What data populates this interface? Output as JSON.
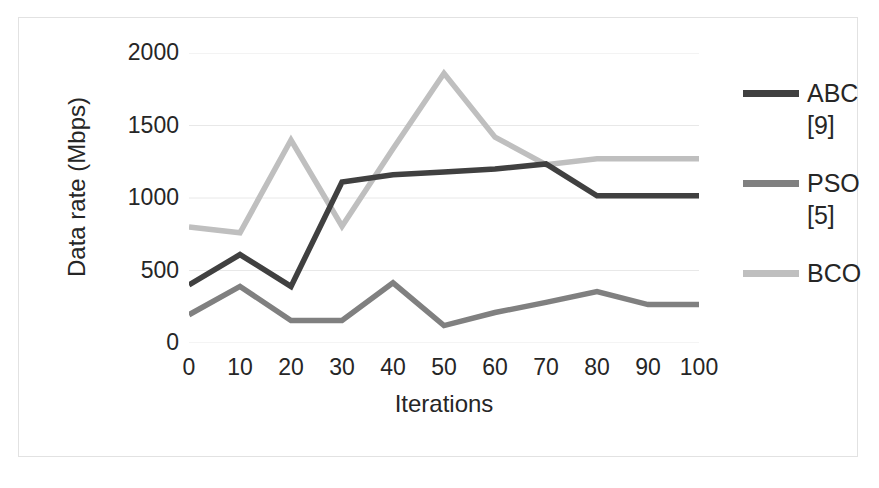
{
  "chart_data": {
    "type": "line",
    "title": "",
    "xlabel": "Iterations",
    "ylabel": "Data rate (Mbps)",
    "x": [
      0,
      10,
      20,
      30,
      40,
      50,
      60,
      70,
      80,
      90,
      100
    ],
    "categories": [
      "0",
      "10",
      "20",
      "30",
      "40",
      "50",
      "60",
      "70",
      "80",
      "90",
      "100"
    ],
    "xlim": [
      0,
      100
    ],
    "ylim": [
      0,
      2000
    ],
    "yticks": [
      0,
      500,
      1000,
      1500,
      2000
    ],
    "ytick_labels": [
      "0",
      "500",
      "1000",
      "1500",
      "2000"
    ],
    "grid": "horizontal",
    "legend_position": "right",
    "series": [
      {
        "name": "ABC [9]",
        "legend_label": "ABC",
        "legend_sublabel": "[9]",
        "color": "#404040",
        "values": [
          400,
          610,
          390,
          1110,
          1160,
          1180,
          1200,
          1235,
          1015,
          1015,
          1015
        ]
      },
      {
        "name": "PSO [5]",
        "legend_label": "PSO",
        "legend_sublabel": "[5]",
        "color": "#808080",
        "values": [
          195,
          390,
          155,
          155,
          415,
          120,
          210,
          280,
          355,
          265,
          265
        ]
      },
      {
        "name": "BCO",
        "legend_label": "BCO",
        "legend_sublabel": "",
        "color": "#bfbfbf",
        "values": [
          800,
          760,
          1400,
          805,
          1340,
          1860,
          1420,
          1230,
          1270,
          1270,
          1270
        ]
      }
    ]
  },
  "axes": {
    "x_title": "Iterations",
    "y_title": "Data rate (Mbps)"
  },
  "colors": {
    "gridline": "#e8e8e8",
    "frame": "#e2e2e2",
    "text": "#262626",
    "background": "#ffffff"
  }
}
